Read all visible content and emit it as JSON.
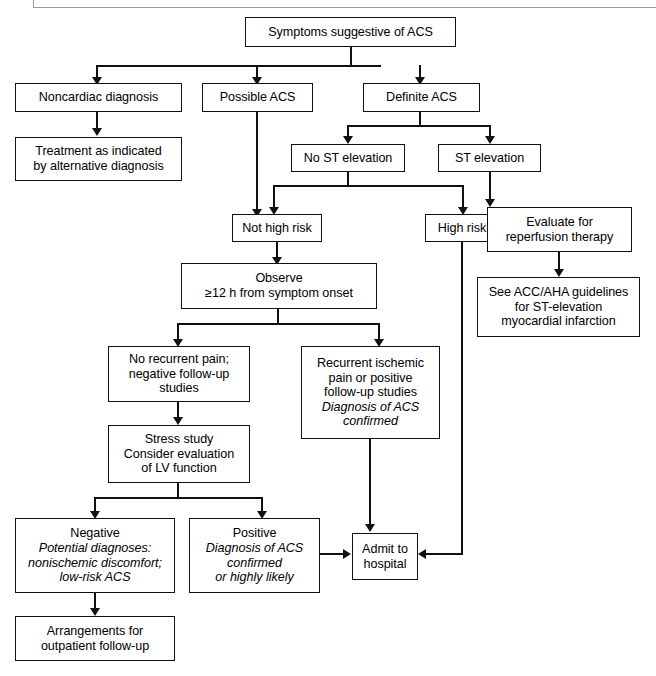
{
  "diagram": {
    "title_text": "Acute coronary syndrome evaluation algorithm",
    "line_color": "#111111",
    "box_border_color": "#111111",
    "background_color": "#ffffff",
    "rule_color": "#9a9a9a"
  },
  "nodes": {
    "symptoms": {
      "lines": [
        {
          "text": "Symptoms suggestive of ACS",
          "italic": false
        }
      ]
    },
    "noncardiac": {
      "lines": [
        {
          "text": "Noncardiac diagnosis",
          "italic": false
        }
      ]
    },
    "possible_acs": {
      "lines": [
        {
          "text": "Possible ACS",
          "italic": false
        }
      ]
    },
    "definite_acs": {
      "lines": [
        {
          "text": "Definite ACS",
          "italic": false
        }
      ]
    },
    "treatment": {
      "lines": [
        {
          "text": "Treatment as indicated",
          "italic": false
        },
        {
          "text": "by alternative diagnosis",
          "italic": false
        }
      ]
    },
    "no_st_elevation": {
      "lines": [
        {
          "text": "No ST elevation",
          "italic": false
        }
      ]
    },
    "st_elevation": {
      "lines": [
        {
          "text": "ST elevation",
          "italic": false
        }
      ]
    },
    "not_high_risk": {
      "lines": [
        {
          "text": "Not high risk",
          "italic": false
        }
      ]
    },
    "high_risk": {
      "lines": [
        {
          "text": "High risk",
          "italic": false
        }
      ]
    },
    "evaluate_reperfusion": {
      "lines": [
        {
          "text": "Evaluate for",
          "italic": false
        },
        {
          "text": "reperfusion therapy",
          "italic": false
        }
      ]
    },
    "acc_aha": {
      "lines": [
        {
          "text": "See ACC/AHA guidelines",
          "italic": false
        },
        {
          "text": "for ST-elevation",
          "italic": false
        },
        {
          "text": "myocardial infarction",
          "italic": false
        }
      ]
    },
    "observe": {
      "lines": [
        {
          "text": "Observe",
          "italic": false
        },
        {
          "text": "≥12 h from symptom onset",
          "italic": false
        }
      ]
    },
    "no_recurrent_pain": {
      "lines": [
        {
          "text": "No recurrent pain;",
          "italic": false
        },
        {
          "text": "negative follow-up",
          "italic": false
        },
        {
          "text": "studies",
          "italic": false
        }
      ]
    },
    "recurrent_ischemic": {
      "lines": [
        {
          "text": "Recurrent ischemic",
          "italic": false
        },
        {
          "text": "pain or positive",
          "italic": false
        },
        {
          "text": "follow-up studies",
          "italic": false
        },
        {
          "text": "Diagnosis of ACS",
          "italic": true
        },
        {
          "text": "confirmed",
          "italic": true
        }
      ]
    },
    "stress_study": {
      "lines": [
        {
          "text": "Stress study",
          "italic": false
        },
        {
          "text": "Consider evaluation",
          "italic": false
        },
        {
          "text": "of LV function",
          "italic": false
        }
      ]
    },
    "negative": {
      "lines": [
        {
          "text": "Negative",
          "italic": false
        },
        {
          "text": "Potential diagnoses:",
          "italic": true
        },
        {
          "text": "nonischemic discomfort;",
          "italic": true
        },
        {
          "text": "low-risk ACS",
          "italic": true
        }
      ]
    },
    "positive": {
      "lines": [
        {
          "text": "Positive",
          "italic": false
        },
        {
          "text": "Diagnosis of ACS",
          "italic": true
        },
        {
          "text": "confirmed",
          "italic": true
        },
        {
          "text": "or highly likely",
          "italic": true
        }
      ]
    },
    "admit": {
      "lines": [
        {
          "text": "Admit to",
          "italic": false
        },
        {
          "text": "hospital",
          "italic": false
        }
      ]
    },
    "arrangements": {
      "lines": [
        {
          "text": "Arrangements for",
          "italic": false
        },
        {
          "text": "outpatient follow-up",
          "italic": false
        }
      ]
    }
  }
}
